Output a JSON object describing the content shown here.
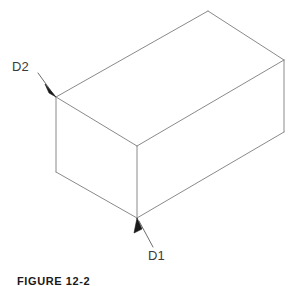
{
  "figure": {
    "caption": "FIGURE 12-2",
    "background_color": "#ffffff",
    "line_color": "#8a8a8a",
    "label_color": "#3b3b3b",
    "leader_color": "#6e6e6e",
    "arrow_color": "#1a1a1a"
  },
  "labels": {
    "d2": "D2",
    "d1": "D1"
  },
  "geometry": {
    "type": "isometric-rectangular-box",
    "vertices": {
      "top_back": [
        208,
        11
      ],
      "top_right": [
        284,
        60
      ],
      "top_left": [
        56,
        97
      ],
      "top_front": [
        137,
        146
      ],
      "bottom_right": [
        284,
        132
      ],
      "bottom_left": [
        56,
        172
      ],
      "bottom_front": [
        137,
        218
      ]
    },
    "edges": [
      [
        "top_left",
        "top_back"
      ],
      [
        "top_back",
        "top_right"
      ],
      [
        "top_left",
        "top_front"
      ],
      [
        "top_front",
        "top_right"
      ],
      [
        "top_left",
        "bottom_left"
      ],
      [
        "top_front",
        "bottom_front"
      ],
      [
        "top_right",
        "bottom_right"
      ],
      [
        "bottom_left",
        "bottom_front"
      ],
      [
        "bottom_front",
        "bottom_right"
      ]
    ]
  },
  "leaders": {
    "d2": {
      "from": [
        38,
        73
      ],
      "to": [
        56,
        97
      ],
      "label_anchor": "upper-left",
      "arrow_at": "to"
    },
    "d1": {
      "from": [
        153,
        247
      ],
      "to": [
        137,
        218
      ],
      "label_anchor": "lower-right",
      "arrow_at": "to"
    }
  }
}
